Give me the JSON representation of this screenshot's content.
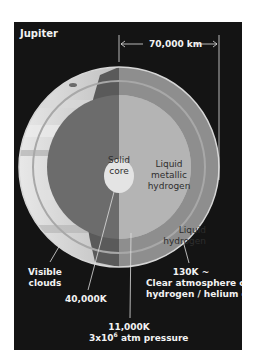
{
  "title": "Jupiter",
  "dimension": {
    "label": "70,000 km"
  },
  "layers": {
    "core": {
      "line1": "Solid",
      "line2": "core"
    },
    "metallic": {
      "line1": "Liquid",
      "line2": "metallic",
      "line3": "hydrogen"
    },
    "liquid_h": {
      "line1": "Liquid",
      "line2": "hydrogen"
    }
  },
  "callouts": {
    "clouds": {
      "line1": "Visible",
      "line2": "clouds"
    },
    "core_temp": "40,000K",
    "boundary": {
      "temp": "11,000K",
      "pressure_prefix": "3x10",
      "pressure_exp": "6",
      "pressure_suffix": " atm pressure"
    },
    "atmosphere": {
      "line1": "130K ~",
      "line2": "Clear atmosphere of",
      "line3": "hydrogen / helium gas"
    }
  },
  "colors": {
    "background": "#141414",
    "surface": "#c8c8c8",
    "dark_wedge": "#5a5a5a",
    "liquid_h": "#8e8e8e",
    "metallic": "#b4b4b4",
    "core": "#e4e4e4",
    "text_light": "#f2f2f2"
  }
}
